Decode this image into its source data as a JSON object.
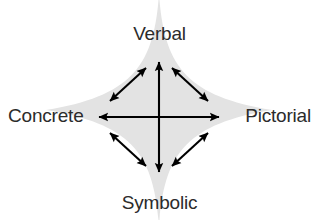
{
  "diagram": {
    "background_color": "#ffffff",
    "star_fill_color": "#e3e3e3",
    "arrow_color": "#000000",
    "label_color": "#2b2b2b",
    "nodes": {
      "top": "Verbal",
      "left": "Concrete",
      "right": "Pictorial",
      "bottom": "Symbolic"
    },
    "center": {
      "x": 159,
      "y": 117
    },
    "arrows": [
      {
        "name": "vertical-axis",
        "from": "center",
        "to": "Verbal-Symbolic",
        "double_headed": true
      },
      {
        "name": "horizontal-axis",
        "from": "center",
        "to": "Concrete-Pictorial",
        "double_headed": true
      },
      {
        "name": "upper-left-diagonal",
        "from": "Concrete",
        "to": "Verbal",
        "double_headed": true
      },
      {
        "name": "upper-right-diagonal",
        "from": "Verbal",
        "to": "Pictorial",
        "double_headed": true
      },
      {
        "name": "lower-left-diagonal",
        "from": "Concrete",
        "to": "Symbolic",
        "double_headed": true
      },
      {
        "name": "lower-right-diagonal",
        "from": "Symbolic",
        "to": "Pictorial",
        "double_headed": true
      }
    ]
  }
}
